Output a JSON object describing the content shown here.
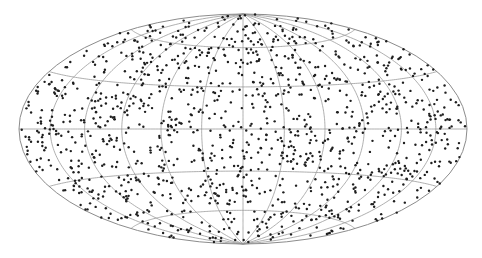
{
  "chart_data": {
    "type": "scatter",
    "title": "",
    "subtitle": "",
    "xlabel": "",
    "ylabel": "",
    "projection": "hammer",
    "graticule": {
      "meridians_step_deg": 30,
      "parallels_deg": [
        -60,
        -30,
        0,
        30,
        60
      ],
      "grid": true,
      "line_color": "#9a9a9a"
    },
    "points": {
      "count": 1300,
      "distribution": "uniform on sphere",
      "marker": "dot",
      "marker_size_px": 2.4,
      "color": "#1e1e1e"
    },
    "xlim_deg": [
      -180,
      180
    ],
    "ylim_deg": [
      -90,
      90
    ],
    "legend": null,
    "tick_labels": []
  },
  "layout": {
    "center_x": 243,
    "center_y": 129,
    "radius_x": 224,
    "radius_y": 115,
    "background": "#ffffff",
    "outline_color": "#8c8c8c"
  },
  "render": {
    "seed": 20240517
  }
}
